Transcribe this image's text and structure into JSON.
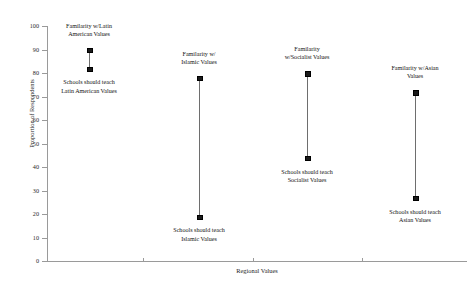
{
  "chart_data": {
    "type": "scatter",
    "title": "",
    "xlabel": "Regional Values",
    "ylabel": "Proportion of Respondents",
    "ylim": [
      0,
      100
    ],
    "ytick_labels": [
      "100",
      "90",
      "80",
      "70",
      "60",
      "50",
      "40",
      "30",
      "20",
      "10",
      "0"
    ],
    "ytick_values": [
      100,
      90,
      80,
      70,
      60,
      50,
      40,
      30,
      20,
      10,
      0
    ],
    "xtick_labels": [
      "",
      "",
      ""
    ],
    "grid": false,
    "legend": "none",
    "categories": [
      "Latin American Values",
      "Islamic Values",
      "Socialist Values",
      "Asian Values"
    ],
    "series": [
      {
        "name": "Familarity with Regional Values",
        "values": [
          90,
          78,
          80,
          72
        ]
      },
      {
        "name": "Schools should teach Regional Values",
        "values": [
          82,
          19,
          44,
          27
        ]
      }
    ],
    "groups": [
      {
        "category": "Latin American Values",
        "x_pos": 89,
        "familiarity": 90,
        "schools_should_teach": 82,
        "top_annotation": "Familarity w/Latin\nAmerican Values",
        "bottom_annotation": "Schools should teach\nLatin American Values"
      },
      {
        "category": "Islamic Values",
        "x_pos": 199,
        "familiarity": 78,
        "schools_should_teach": 19,
        "top_annotation": "Familarity w/\nIslamic Values",
        "bottom_annotation": "Schools should teach\nIslamic Values"
      },
      {
        "category": "Socialist Values",
        "x_pos": 307,
        "familiarity": 80,
        "schools_should_teach": 44,
        "top_annotation": "Familarity\nw/Socialist Values",
        "bottom_annotation": "Schools should teach\nSocialist Values"
      },
      {
        "category": "Asian Values",
        "x_pos": 415,
        "familiarity": 72,
        "schools_should_teach": 27,
        "top_annotation": "Familarity w/Asian Values",
        "bottom_annotation": "Schools should teach\nAsian Values"
      }
    ]
  },
  "colors": {
    "marker": "#1a1a1a",
    "line": "#6e6e6e",
    "axis": "#9a9a9a",
    "text": "#111111",
    "background": "#ffffff"
  }
}
